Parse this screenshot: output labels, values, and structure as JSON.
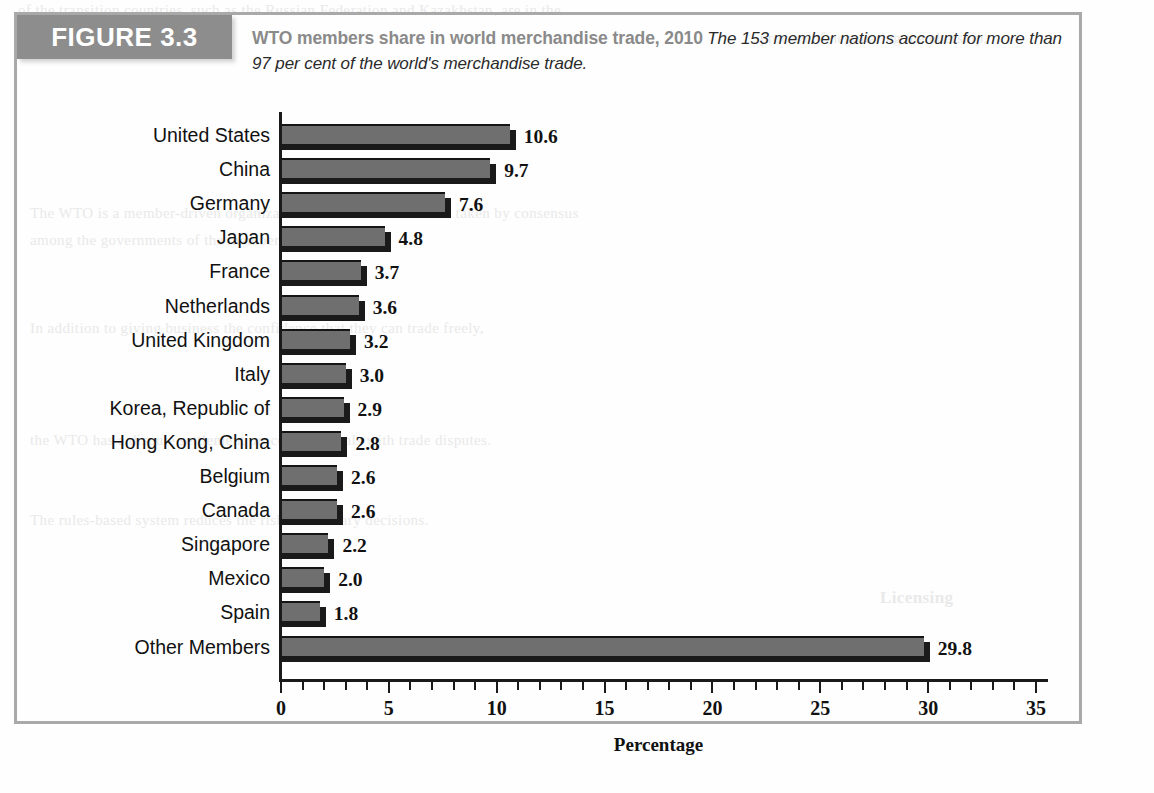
{
  "figure": {
    "tag": "FIGURE 3.3",
    "title": "WTO members share in world merchandise trade, 2010",
    "subtitle": "The 153 member nations account for more than 97 per cent of the world's merchandise trade.",
    "border_color": "#a9a9a9",
    "tag_bg": "#8d8d8d",
    "title_color": "#8a8a8a"
  },
  "chart_data": {
    "type": "bar",
    "orientation": "horizontal",
    "title": "WTO members share in world merchandise trade, 2010",
    "xlabel": "Percentage",
    "ylabel": "",
    "xlim": [
      0,
      35
    ],
    "xticks": [
      0,
      5,
      10,
      15,
      20,
      25,
      30,
      35
    ],
    "minor_tick_step": 1,
    "grid": false,
    "legend": null,
    "bar_color": "#6f6f6f",
    "bar_edge_color": "#1a1a1a",
    "categories": [
      "United States",
      "China",
      "Germany",
      "Japan",
      "France",
      "Netherlands",
      "United Kingdom",
      "Italy",
      "Korea, Republic of",
      "Hong Kong, China",
      "Belgium",
      "Canada",
      "Singapore",
      "Mexico",
      "Spain",
      "Other Members"
    ],
    "values": [
      10.6,
      9.7,
      7.6,
      4.8,
      3.7,
      3.6,
      3.2,
      3.0,
      2.9,
      2.8,
      2.6,
      2.6,
      2.2,
      2.0,
      1.8,
      29.8
    ],
    "value_labels": [
      "10.6",
      "9.7",
      "7.6",
      "4.8",
      "3.7",
      "3.6",
      "3.2",
      "3.0",
      "2.9",
      "2.8",
      "2.6",
      "2.6",
      "2.2",
      "2.0",
      "1.8",
      "29.8"
    ]
  },
  "background_text": [
    "of the transition countries, such as the Russian Federation and Kazakhstan, are in the",
    "process of negotiating membership.",
    "The WTO is a member-driven organization in which decisions are taken by consensus",
    "among the governments of the member nations.",
    "In addition to giving business the confidence that they can trade freely,",
    "the WTO has a dispute settlement process that deals with trade disputes.",
    "The rules-based system reduces the risk of arbitrary decisions.",
    "Licensing"
  ]
}
